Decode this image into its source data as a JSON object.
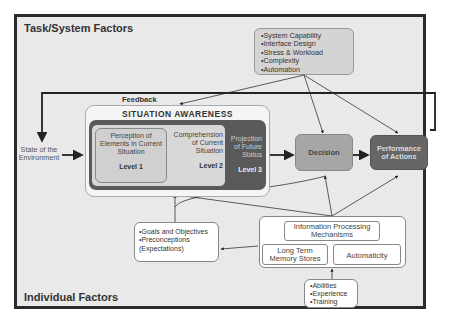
{
  "diagram": {
    "task_system_title": "Task/System Factors",
    "individual_title": "Individual Factors",
    "task_factors": [
      "•System Capability",
      "•Interface Design",
      "•Stress & Workload",
      "•Complexity",
      "•Automation"
    ],
    "feedback_label": "Feedback",
    "state_env": [
      "State of the",
      "Environment"
    ],
    "sa_title": "SITUATION AWARENESS",
    "levels": [
      {
        "text": [
          "Perception of",
          "Elements in Current",
          "Situation"
        ],
        "label": "Level 1"
      },
      {
        "text": [
          "Comprehension",
          "of Current",
          "Situation"
        ],
        "label": "Level 2"
      },
      {
        "text": [
          "Projection",
          "of Future",
          "Status"
        ],
        "label": "Level 3"
      }
    ],
    "decision": "Decision",
    "performance": [
      "Performance",
      "of Actions"
    ],
    "goals": [
      "•Goals and Objectives",
      "•Preconceptions",
      "(Expectations)"
    ],
    "info_processing": [
      "Information Processing",
      "Mechanisms"
    ],
    "ltm": [
      "Long Term",
      "Memory Stores"
    ],
    "automaticity": "Automaticity",
    "abilities": [
      "•Abilities",
      "•Experience",
      "•Training"
    ],
    "colors": {
      "background": "#e9e9e9",
      "frame": "#2b2b2b",
      "sa_dark": "#5a5a5a",
      "level_light": "#d4d4d4",
      "decision": "#a6a6a6",
      "performance": "#666666",
      "task_box": "#d4d4d4"
    }
  }
}
